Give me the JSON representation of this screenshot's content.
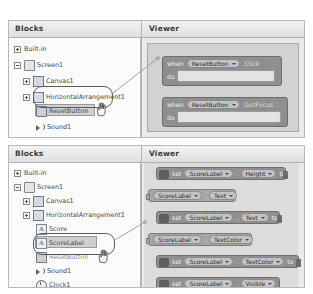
{
  "panels": [
    {
      "id": "top",
      "blocks_header": "Blocks",
      "viewer_header": "Viewer",
      "tree": [
        {
          "label": "Built-in",
          "icon": "plus-expander-icon",
          "node_icon": "none",
          "indent": 0,
          "expander": "plus",
          "selected": false
        },
        {
          "label": "Screen1",
          "icon": "screen-icon",
          "node_icon": "screen",
          "indent": 0,
          "expander": "minus",
          "selected": false
        },
        {
          "label": "Canvas1",
          "icon": "canvas-icon",
          "node_icon": "canvas",
          "indent": 1,
          "expander": "plus",
          "selected": false
        },
        {
          "label": "HorizontalArrangement1",
          "icon": "arrangement-icon",
          "node_icon": "harr",
          "indent": 1,
          "expander": "plus",
          "selected": false
        },
        {
          "label": "ResetButton",
          "icon": "button-icon",
          "node_icon": "button",
          "indent": 2,
          "expander": "none",
          "selected": true
        },
        {
          "label": "Sound1",
          "icon": "sound-icon",
          "node_icon": "sound",
          "indent": 2,
          "expander": "none",
          "selected": false
        }
      ],
      "blocks": [
        {
          "kind": "event",
          "when_label": "when",
          "component": "ResetButton",
          "event": ".Click",
          "do_label": "do"
        },
        {
          "kind": "event",
          "when_label": "when",
          "component": "ResetButton",
          "event": ".GotFocus",
          "do_label": "do"
        }
      ]
    },
    {
      "id": "bottom",
      "blocks_header": "Blocks",
      "viewer_header": "Viewer",
      "tree": [
        {
          "label": "Built-in",
          "icon": "plus-expander-icon",
          "node_icon": "none",
          "indent": 0,
          "expander": "plus",
          "selected": false
        },
        {
          "label": "Screen1",
          "icon": "screen-icon",
          "node_icon": "screen",
          "indent": 0,
          "expander": "minus",
          "selected": false
        },
        {
          "label": "Canvas1",
          "icon": "canvas-icon",
          "node_icon": "canvas",
          "indent": 1,
          "expander": "plus",
          "selected": false
        },
        {
          "label": "HorizontalArrangement1",
          "icon": "arrangement-icon",
          "node_icon": "harr",
          "indent": 1,
          "expander": "plus",
          "selected": false
        },
        {
          "label": "Score",
          "icon": "label-icon",
          "node_icon": "label",
          "indent": 2,
          "expander": "none",
          "selected": false
        },
        {
          "label": "ScoreLabel",
          "icon": "label-icon",
          "node_icon": "label",
          "indent": 2,
          "expander": "none",
          "selected": true
        },
        {
          "label": "ResetButton",
          "icon": "button-icon",
          "node_icon": "button",
          "indent": 2,
          "expander": "none",
          "selected": false
        },
        {
          "label": "Sound1",
          "icon": "sound-icon",
          "node_icon": "sound",
          "indent": 2,
          "expander": "none",
          "selected": false
        },
        {
          "label": "Clock1",
          "icon": "clock-icon",
          "node_icon": "clock",
          "indent": 2,
          "expander": "none",
          "selected": false
        }
      ],
      "blocks": [
        {
          "kind": "setter",
          "set_label": "set",
          "component": "ScoreLabel",
          "property": "Height",
          "to_label": "to"
        },
        {
          "kind": "getter",
          "component": "ScoreLabel",
          "property": "Text"
        },
        {
          "kind": "setter",
          "set_label": "set",
          "component": "ScoreLabel",
          "property": "Text",
          "to_label": "to"
        },
        {
          "kind": "getter",
          "component": "ScoreLabel",
          "property": "TextColor"
        },
        {
          "kind": "setter",
          "set_label": "set",
          "component": "ScoreLabel",
          "property": "TextColor",
          "to_label": "to"
        },
        {
          "kind": "setter",
          "set_label": "set",
          "component": "ScoreLabel",
          "property": "Visible",
          "to_label": "to"
        }
      ]
    }
  ],
  "icons": {
    "label_glyph": "A",
    "dot_separator": ".",
    "cursor": "hand-cursor"
  },
  "colors": {
    "panel_bg": "#e8e8e8",
    "tree_bg": "#fbfbfb",
    "canvas_bg": "#d2d2d2",
    "block_event": "#8f8f8f",
    "block_setter": "#909090",
    "block_getter": "#a6a6a6",
    "callout_stroke": "#5c5c5c"
  }
}
